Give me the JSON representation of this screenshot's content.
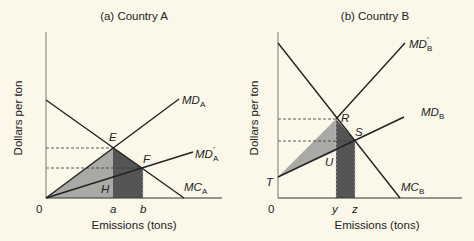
{
  "panels": [
    {
      "title": "(a) Country A",
      "ylabel": "Dollars per ton",
      "xlabel": "Emissions (tons)",
      "origin_label": "0",
      "x_ticks": [
        "a",
        "b"
      ],
      "points": [
        "E",
        "F",
        "H"
      ],
      "curves": {
        "md": {
          "base": "MD",
          "sub": "A"
        },
        "md_prime": {
          "base": "MD",
          "sub": "A",
          "prime": "′"
        },
        "mc": {
          "base": "MC",
          "sub": "A"
        }
      }
    },
    {
      "title": "(b) Country B",
      "ylabel": "Dollars per ton",
      "xlabel": "Emissions (tons)",
      "origin_label": "0",
      "x_ticks": [
        "y",
        "z"
      ],
      "points": [
        "R",
        "S",
        "U",
        "T"
      ],
      "curves": {
        "md_prime": {
          "base": "MD",
          "sub": "B",
          "prime": "′"
        },
        "md": {
          "base": "MD",
          "sub": "B"
        },
        "mc": {
          "base": "MC",
          "sub": "B"
        }
      }
    }
  ],
  "colors": {
    "background": "#fbf8ea",
    "line": "#222222",
    "light_shade": "#a9a9a6",
    "dark_shade": "#555555"
  }
}
